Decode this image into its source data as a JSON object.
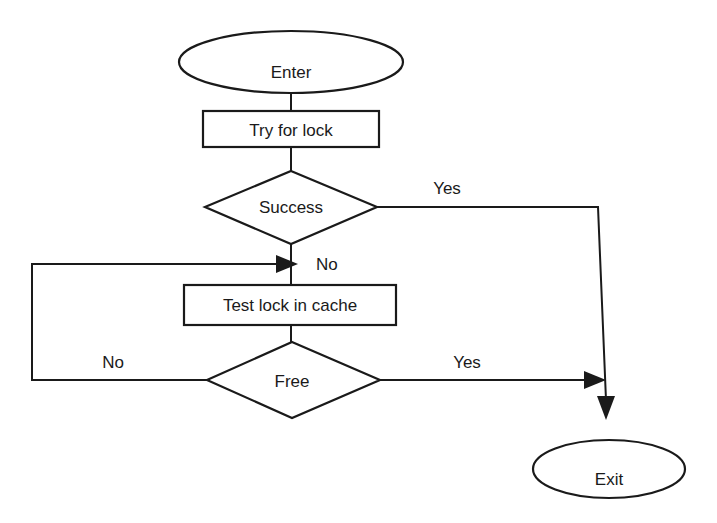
{
  "diagram": {
    "type": "flowchart",
    "nodes": {
      "enter": {
        "label": "Enter",
        "shape": "ellipse"
      },
      "try_lock": {
        "label": "Try for lock",
        "shape": "rectangle"
      },
      "success": {
        "label": "Success",
        "shape": "diamond"
      },
      "test_cache": {
        "label": "Test lock in cache",
        "shape": "rectangle"
      },
      "free": {
        "label": "Free",
        "shape": "diamond"
      },
      "exit": {
        "label": "Exit",
        "shape": "ellipse"
      }
    },
    "edges": {
      "success_yes": {
        "from": "Success",
        "to": "Exit",
        "label": "Yes"
      },
      "success_no": {
        "from": "Success",
        "to": "Test lock in cache",
        "label": "No"
      },
      "free_yes": {
        "from": "Free",
        "to": "Exit",
        "label": "Yes"
      },
      "free_no": {
        "from": "Free",
        "to": "Test lock in cache",
        "label": "No"
      }
    },
    "colors": {
      "stroke": "#1a1a1a",
      "background": "#ffffff"
    }
  }
}
